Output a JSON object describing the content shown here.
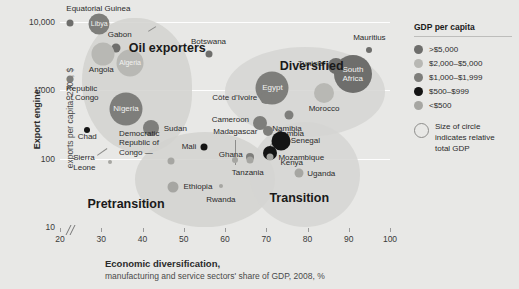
{
  "chart_data": {
    "type": "scatter",
    "title": "",
    "xlabel": "Economic diversification,",
    "xlabel_sub": "manufacturing and service sectors' share of GDP, 2008, %",
    "ylabel": "Export engine,",
    "ylabel_sub": "exports per capita, 2008, $",
    "xlim": [
      20,
      100
    ],
    "ylim": [
      10,
      10000
    ],
    "yscale": "log",
    "xticks": [
      "20",
      "30",
      "40",
      "50",
      "60",
      "70",
      "80",
      "90",
      "100"
    ],
    "yticks": [
      "10,000",
      "1,000",
      "100",
      "10"
    ],
    "grid": "horizontal-white",
    "legend_position": "right",
    "clusters": [
      {
        "name": "Oil exporters",
        "x": 46,
        "y": 4200
      },
      {
        "name": "Diversified",
        "x": 81,
        "y": 2300
      },
      {
        "name": "Pretransition",
        "x": 36,
        "y": 22
      },
      {
        "name": "Transition",
        "x": 78,
        "y": 27
      }
    ],
    "points": [
      {
        "name": "Equatorial Guinea",
        "x": 22.5,
        "y": 9800,
        "size": 7,
        "tier": ">$5,000"
      },
      {
        "name": "Libya",
        "x": 29.5,
        "y": 9200,
        "size": 21,
        "tier": "$1,000-$1,999"
      },
      {
        "name": "Gabon",
        "x": 33.5,
        "y": 4100,
        "size": 9,
        "tier": ">$5,000"
      },
      {
        "name": "Angola",
        "x": 30.5,
        "y": 3400,
        "size": 23,
        "tier": "$2,000-$5,000"
      },
      {
        "name": "Algeria",
        "x": 37,
        "y": 2500,
        "size": 27,
        "tier": "$2,000-$5,000"
      },
      {
        "name": "Botswana",
        "x": 56,
        "y": 3400,
        "size": 7,
        "tier": ">$5,000"
      },
      {
        "name": "Republic of Congo",
        "x": 22.5,
        "y": 1450,
        "size": 7,
        "tier": "$1,000-$1,999"
      },
      {
        "name": "Nigeria",
        "x": 36,
        "y": 530,
        "size": 33,
        "tier": "$1,000-$1,999"
      },
      {
        "name": "Chad",
        "x": 26.5,
        "y": 260,
        "size": 6,
        "tier": "$500-$999"
      },
      {
        "name": "Sudan",
        "x": 42,
        "y": 280,
        "size": 16,
        "tier": "$1,000-$1,999"
      },
      {
        "name": "Mauritius",
        "x": 95,
        "y": 3900,
        "size": 6,
        "tier": ">$5,000"
      },
      {
        "name": "South Africa",
        "x": 91,
        "y": 1750,
        "size": 38,
        "tier": ">$5,000"
      },
      {
        "name": "Tunisia",
        "x": 87,
        "y": 2300,
        "size": 16,
        "tier": ">$5,000"
      },
      {
        "name": "Egypt",
        "x": 71.5,
        "y": 1100,
        "size": 33,
        "tier": "$1,000-$1,999"
      },
      {
        "name": "Morocco",
        "x": 84,
        "y": 900,
        "size": 20,
        "tier": "$2,000-$5,000"
      },
      {
        "name": "Cote d'Ivoire",
        "x": 70,
        "y": 780,
        "size": 12,
        "tier": "$1,000-$1,999"
      },
      {
        "name": "Namibia",
        "x": 75.5,
        "y": 430,
        "size": 9,
        "tier": "$1,000-$1,999"
      },
      {
        "name": "Cameroon",
        "x": 68.5,
        "y": 330,
        "size": 14,
        "tier": "$1,000-$1,999"
      },
      {
        "name": "Zambia",
        "x": 70.5,
        "y": 250,
        "size": 10,
        "tier": "$1,000-$1,999"
      },
      {
        "name": "Senegal",
        "x": 73.5,
        "y": 180,
        "size": 19,
        "tier": "$500-$999"
      },
      {
        "name": "Kenya",
        "x": 71,
        "y": 120,
        "size": 14,
        "tier": "$500-$999"
      },
      {
        "name": "Ghana",
        "x": 66,
        "y": 105,
        "size": 8,
        "tier": "$1,000-$1,999"
      },
      {
        "name": "Mozambique",
        "x": 71,
        "y": 105,
        "size": 7,
        "tier": "<$500"
      },
      {
        "name": "Uganda",
        "x": 78,
        "y": 62,
        "size": 9,
        "tier": "<$500"
      },
      {
        "name": "Tanzania",
        "x": 66,
        "y": 95,
        "size": 7,
        "tier": "<$500"
      },
      {
        "name": "Madagascar",
        "x": 62.5,
        "y": 95,
        "size": 6,
        "tier": "<$500"
      },
      {
        "name": "Mali",
        "x": 55,
        "y": 150,
        "size": 7,
        "tier": "$500-$999"
      },
      {
        "name": "Democratic Republic of Congo",
        "x": 47,
        "y": 92,
        "size": 7,
        "tier": "<$500"
      },
      {
        "name": "Sierra Leone",
        "x": 32,
        "y": 88,
        "size": 4,
        "tier": "<$500"
      },
      {
        "name": "Ethiopia",
        "x": 47.5,
        "y": 38,
        "size": 11,
        "tier": "<$500"
      },
      {
        "name": "Rwanda",
        "x": 59,
        "y": 40,
        "size": 4,
        "tier": "<$500"
      }
    ]
  },
  "legend": {
    "title": "GDP per capita",
    "items": [
      {
        "label": ">$5,000",
        "color": "#6e6e6c"
      },
      {
        "label": "$2,000–$5,000",
        "color": "#b8b8b4"
      },
      {
        "label": "$1,000–$1,999",
        "color": "#7e7e7b"
      },
      {
        "label": "$500–$999",
        "color": "#141414"
      },
      {
        "label": "<$500",
        "color": "#a6a6a2"
      }
    ],
    "size_note_line1": "Size of circle",
    "size_note_line2": "indicates relative",
    "size_note_line3": "total GDP"
  },
  "axes": {
    "y_title": "Export engine,",
    "y_subtitle": "exports per capita, 2008, $",
    "x_title": "Economic diversification,",
    "x_subtitle": "manufacturing and service sectors' share of GDP, 2008, %",
    "y_ticks": [
      "10,000",
      "1,000",
      "100",
      "10"
    ],
    "x_ticks": [
      "20",
      "30",
      "40",
      "50",
      "60",
      "70",
      "80",
      "90",
      "100"
    ]
  },
  "colors": {
    "background": "#e8e8e6",
    "gridline": "#ffffff",
    "blob": "#d2d2cf",
    "text": "#2b2b2b"
  }
}
